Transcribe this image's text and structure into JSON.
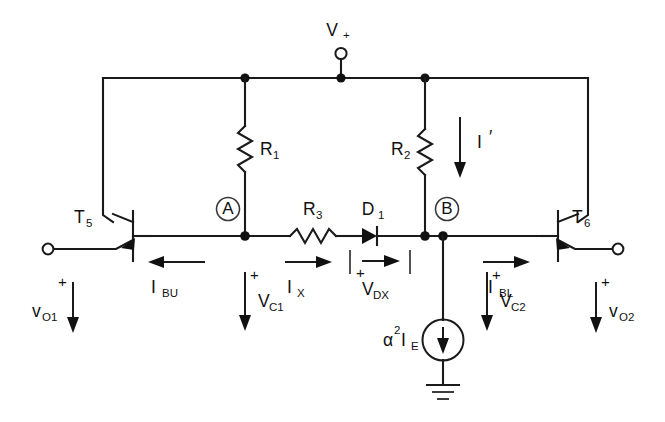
{
  "diagram": {
    "supply": {
      "label": "V",
      "sublabel": "+",
      "terminal_icon": "open-terminal-circle"
    },
    "components": {
      "r1": {
        "label": "R",
        "sub": "1",
        "type": "resistor",
        "orientation": "vertical"
      },
      "r2": {
        "label": "R",
        "sub": "2",
        "type": "resistor",
        "orientation": "vertical"
      },
      "r3": {
        "label": "R",
        "sub": "3",
        "type": "resistor",
        "orientation": "horizontal"
      },
      "d1": {
        "label": "D",
        "sub": "1",
        "type": "diode",
        "orientation": "right"
      },
      "t5": {
        "label": "T",
        "sub": "5",
        "type": "npn-transistor"
      },
      "t6": {
        "label": "T",
        "sub": "6",
        "type": "npn-transistor"
      },
      "current_source": {
        "label": "α",
        "exponent": "2",
        "label2": "I",
        "sub2": "E",
        "type": "current-source",
        "direction": "down"
      },
      "ground": {
        "type": "ground-symbol"
      }
    },
    "nodes": [
      {
        "id": "A",
        "label": "A"
      },
      {
        "id": "B",
        "label": "B"
      }
    ],
    "currents": [
      {
        "id": "ibu",
        "label": "I",
        "sub": "BU",
        "direction": "left"
      },
      {
        "id": "ix",
        "label": "I",
        "sub": "X",
        "direction": "right"
      },
      {
        "id": "ibl",
        "label": "I",
        "sub": "BL",
        "direction": "right"
      },
      {
        "id": "iprime",
        "label": "I",
        "sub": "′",
        "direction": "down"
      }
    ],
    "voltages": [
      {
        "id": "vo1",
        "label": "v",
        "sub": "O1",
        "polarity": "+",
        "direction": "down"
      },
      {
        "id": "vc1",
        "label": "V",
        "sub": "C1",
        "polarity": "+",
        "direction": "down"
      },
      {
        "id": "vdx",
        "label": "V",
        "sub": "DX",
        "polarity": "+",
        "direction": "right"
      },
      {
        "id": "vc2",
        "label": "V",
        "sub": "C2",
        "polarity": "+",
        "direction": "down"
      },
      {
        "id": "vo2",
        "label": "v",
        "sub": "O2",
        "polarity": "+",
        "direction": "down"
      }
    ],
    "colors": {
      "ink": "#111111",
      "background": "#ffffff"
    }
  }
}
